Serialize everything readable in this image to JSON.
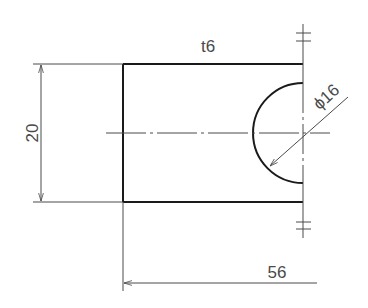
{
  "drawing": {
    "type": "engineering-part-drawing",
    "colors": {
      "outline": "#1a1a1a",
      "thin": "#4a4a4a",
      "background": "#ffffff"
    },
    "annotations": {
      "thickness": "t6",
      "height_dim": "20",
      "length_dim": "56",
      "hole_diameter": "ϕ16"
    },
    "features": {
      "part": "rectangular plate with semicircular notch on right edge",
      "break_symbols": 2,
      "center_line": "horizontal through notch center"
    }
  }
}
